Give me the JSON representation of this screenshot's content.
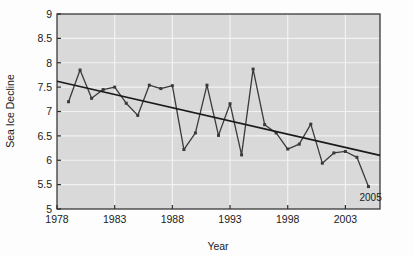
{
  "chart_data": {
    "type": "line",
    "title": "",
    "xlabel": "Year",
    "ylabel": "Sea Ice Decline",
    "xlim": [
      1978,
      2006
    ],
    "ylim": [
      5,
      9
    ],
    "xticks": [
      1978,
      1983,
      1988,
      1993,
      1998,
      2003
    ],
    "yticks": [
      5,
      5.5,
      6,
      6.5,
      7,
      7.5,
      8,
      8.5,
      9
    ],
    "grid": true,
    "legend": "none",
    "plot_background": "#d9d9d9",
    "gridline_color": "#f2f2f2",
    "series": [
      {
        "name": "Sea Ice Decline",
        "color": "#3a3a3a",
        "marker": "square",
        "x": [
          1979,
          1980,
          1981,
          1982,
          1983,
          1984,
          1985,
          1986,
          1987,
          1988,
          1989,
          1990,
          1991,
          1992,
          1993,
          1994,
          1995,
          1996,
          1997,
          1998,
          1999,
          2000,
          2001,
          2002,
          2003,
          2004,
          2005
        ],
        "values": [
          7.2,
          7.85,
          7.27,
          7.45,
          7.5,
          7.17,
          6.92,
          7.54,
          7.47,
          7.53,
          6.22,
          6.56,
          7.54,
          6.51,
          7.16,
          6.11,
          7.87,
          6.73,
          6.56,
          6.23,
          6.33,
          6.74,
          5.94,
          6.15,
          6.18,
          6.06,
          5.46
        ]
      },
      {
        "name": "Linear trend",
        "color": "#1a1a1a",
        "marker": "none",
        "x": [
          1978,
          2006
        ],
        "values": [
          7.62,
          6.1
        ]
      }
    ],
    "annotations": [
      {
        "text": "2005",
        "x": 2005,
        "y": 5.46,
        "position": "below-right"
      }
    ]
  },
  "axes": {
    "x_tick_labels": [
      "1978",
      "1983",
      "1988",
      "1993",
      "1998",
      "2003"
    ],
    "y_tick_labels": [
      "5",
      "5.5",
      "6",
      "6.5",
      "7",
      "7.5",
      "8",
      "8.5",
      "9"
    ],
    "x_axis_title": "Year",
    "y_axis_title": "Sea Ice Decline"
  },
  "annotation_labels": {
    "last_point": "2005"
  }
}
